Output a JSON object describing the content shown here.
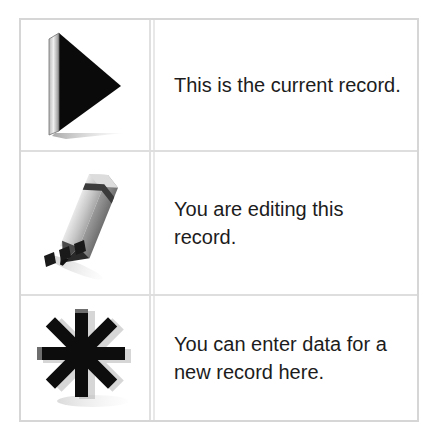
{
  "legend": {
    "title": "Record status legend",
    "border_color": "#d6d6d6",
    "text_color": "#1c1c1c",
    "background_color": "#ffffff",
    "rows": [
      {
        "icon_name": "play-triangle-icon",
        "icon_description": "Black 3D right-pointing triangle with drop shadow",
        "text": "This is the current record."
      },
      {
        "icon_name": "pencil-icon",
        "icon_description": "Gray 3D pencil writing marks, tilted diagonally",
        "text": "You are editing this record."
      },
      {
        "icon_name": "asterisk-icon",
        "icon_description": "Black 3D eight-pointed asterisk star",
        "text": "You can enter data for a new record here."
      }
    ]
  }
}
